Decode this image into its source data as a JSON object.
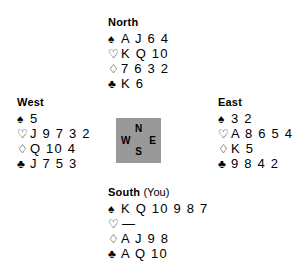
{
  "diagram": {
    "type": "bridge-hand-diagram",
    "background_color": "#ffffff",
    "text_color": "#000000"
  },
  "compass": {
    "box_color": "#999999",
    "north": "N",
    "west": "W",
    "east": "E",
    "south": "S"
  },
  "suits": {
    "spade": "♠",
    "heart": "♡",
    "diamond": "♢",
    "club": "♣"
  },
  "hands": {
    "north": {
      "label": "North",
      "annotation": "",
      "spades": "A J 6 4",
      "hearts": "K Q 10",
      "diamonds": "7 6 3 2",
      "clubs": "K 6"
    },
    "west": {
      "label": "West",
      "annotation": "",
      "spades": "5",
      "hearts": "J 9 7 3 2",
      "diamonds": "Q 10 4",
      "clubs": "J 7 5 3"
    },
    "east": {
      "label": "East",
      "annotation": "",
      "spades": "3 2",
      "hearts": "A 8 6 5 4",
      "diamonds": "K 5",
      "clubs": "9 8 4 2"
    },
    "south": {
      "label": "South",
      "annotation": "(You)",
      "spades": "K Q 10 9 8 7",
      "hearts": "—",
      "diamonds": "A J 9 8",
      "clubs": "A Q 10"
    }
  }
}
